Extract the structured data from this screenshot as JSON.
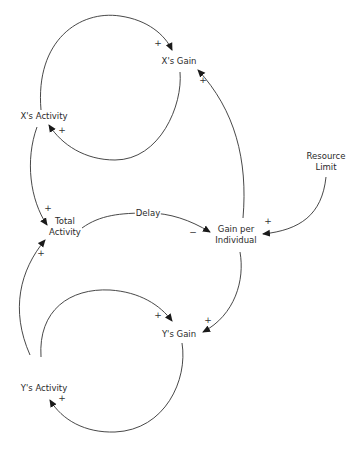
{
  "diagram": {
    "type": "causal-loop-diagram",
    "nodes": {
      "x_gain": "X's Gain",
      "x_activity": "X's Activity",
      "total_activity_l1": "Total",
      "total_activity_l2": "Activity",
      "gain_per_individual_l1": "Gain per",
      "gain_per_individual_l2": "Individual",
      "resource_limit_l1": "Resource",
      "resource_limit_l2": "Limit",
      "y_gain": "Y's Gain",
      "y_activity": "Y's Activity"
    },
    "delay_label": "Delay",
    "links": [
      {
        "from": "X's Activity",
        "to": "X's Gain",
        "polarity": "+"
      },
      {
        "from": "X's Gain",
        "to": "X's Activity",
        "polarity": "+"
      },
      {
        "from": "X's Activity",
        "to": "Total Activity",
        "polarity": "+"
      },
      {
        "from": "Y's Activity",
        "to": "Total Activity",
        "polarity": "+"
      },
      {
        "from": "Total Activity",
        "to": "Gain per Individual",
        "polarity": "−",
        "delay": true
      },
      {
        "from": "Resource Limit",
        "to": "Gain per Individual",
        "polarity": "+"
      },
      {
        "from": "Gain per Individual",
        "to": "X's Gain",
        "polarity": "+"
      },
      {
        "from": "Gain per Individual",
        "to": "Y's Gain",
        "polarity": "+"
      },
      {
        "from": "Y's Activity",
        "to": "Y's Gain",
        "polarity": "+"
      },
      {
        "from": "Y's Gain",
        "to": "Y's Activity",
        "polarity": "+"
      }
    ],
    "polarity_marks": {
      "p1": "+",
      "p2": "+",
      "p3": "+",
      "p4": "+",
      "p5": "−",
      "p6": "+",
      "p7": "+",
      "p8": "+",
      "p9": "+",
      "p10": "+"
    }
  }
}
